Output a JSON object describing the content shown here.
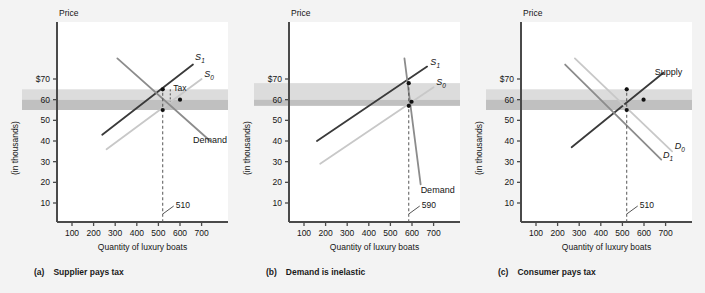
{
  "figure": {
    "background": "#f3f3f3",
    "plot_background": "#ffffff"
  },
  "colors": {
    "axis": "#4a4a4a",
    "text": "#151515",
    "curve_dark": "#3a3a3a",
    "curve_mid": "#8c8c8c",
    "curve_light": "#c8c8c8",
    "band_light": "#dcdcdc",
    "band_dark": "#c0c0c0",
    "dot": "#111111",
    "dashed": "#555555"
  },
  "axes": {
    "y_label_top": "Price",
    "y_label_units": "(in thousands)",
    "x_label": "Quantity of luxury boats",
    "y_ticks": [
      "$70",
      "60",
      "50",
      "40",
      "30",
      "20",
      "10"
    ],
    "y_tick_values": [
      70,
      60,
      50,
      40,
      30,
      20,
      10
    ],
    "x_ticks": [
      "100",
      "200",
      "300",
      "400",
      "500",
      "600",
      "700"
    ],
    "x_tick_values": [
      100,
      200,
      300,
      400,
      500,
      600,
      700
    ],
    "xlim": [
      40,
      790
    ],
    "ylim": [
      0,
      82
    ]
  },
  "panels": [
    {
      "id": "a",
      "caption_letter": "(a)",
      "caption_text": "Supplier pays tax",
      "marker_label": "510",
      "marker_x": 520,
      "tax_label": "Tax",
      "band_light": {
        "from": 60,
        "to": 65
      },
      "band_dark": {
        "from": 55,
        "to": 60
      },
      "curves": [
        {
          "name": "S1",
          "label": "S",
          "sub": "1",
          "style": "dark",
          "x1": 240,
          "y1": 43,
          "x2": 660,
          "y2": 77,
          "label_x": 670,
          "label_y": 79
        },
        {
          "name": "S0",
          "label": "S",
          "sub": "0",
          "style": "light",
          "x1": 260,
          "y1": 36,
          "x2": 700,
          "y2": 70,
          "label_x": 712,
          "label_y": 71
        },
        {
          "name": "Demand",
          "label": "Demand",
          "sub": "",
          "style": "mid",
          "x1": 310,
          "y1": 80,
          "x2": 740,
          "y2": 40,
          "label_x": 660,
          "label_y": 39
        }
      ],
      "points": [
        {
          "x": 520,
          "y": 65
        },
        {
          "x": 520,
          "y": 55
        },
        {
          "x": 600,
          "y": 60
        }
      ]
    },
    {
      "id": "b",
      "caption_letter": "(b)",
      "caption_text": "Demand is inelastic",
      "marker_label": "590",
      "marker_x": 585,
      "tax_label": "",
      "band_light": {
        "from": 60,
        "to": 68
      },
      "band_dark": {
        "from": 57,
        "to": 60
      },
      "curves": [
        {
          "name": "S1",
          "label": "S",
          "sub": "1",
          "style": "dark",
          "x1": 160,
          "y1": 40,
          "x2": 670,
          "y2": 76,
          "label_x": 685,
          "label_y": 77
        },
        {
          "name": "S0",
          "label": "S",
          "sub": "0",
          "style": "light",
          "x1": 175,
          "y1": 29,
          "x2": 700,
          "y2": 66,
          "label_x": 712,
          "label_y": 67
        },
        {
          "name": "Demand",
          "label": "Demand",
          "sub": "",
          "style": "mid",
          "x1": 565,
          "y1": 80,
          "x2": 640,
          "y2": 19,
          "label_x": 640,
          "label_y": 15
        }
      ],
      "points": [
        {
          "x": 585,
          "y": 68
        },
        {
          "x": 585,
          "y": 57
        },
        {
          "x": 598,
          "y": 59
        }
      ]
    },
    {
      "id": "c",
      "caption_letter": "(c)",
      "caption_text": "Consumer pays tax",
      "marker_label": "510",
      "marker_x": 520,
      "tax_label": "",
      "band_light": {
        "from": 60,
        "to": 65
      },
      "band_dark": {
        "from": 55,
        "to": 60
      },
      "curves": [
        {
          "name": "Supply",
          "label": "Supply",
          "sub": "",
          "style": "dark",
          "x1": 265,
          "y1": 37,
          "x2": 690,
          "y2": 73,
          "label_x": 650,
          "label_y": 72
        },
        {
          "name": "D0",
          "label": "D",
          "sub": "0",
          "style": "light",
          "x1": 280,
          "y1": 80,
          "x2": 730,
          "y2": 35,
          "label_x": 742,
          "label_y": 36
        },
        {
          "name": "D1",
          "label": "D",
          "sub": "1",
          "style": "mid",
          "x1": 235,
          "y1": 77,
          "x2": 680,
          "y2": 31,
          "label_x": 688,
          "label_y": 32
        }
      ],
      "points": [
        {
          "x": 520,
          "y": 65
        },
        {
          "x": 520,
          "y": 55
        },
        {
          "x": 598,
          "y": 60
        }
      ]
    }
  ]
}
